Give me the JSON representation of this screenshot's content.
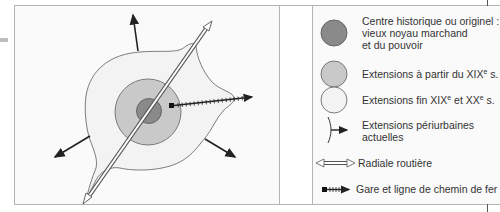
{
  "diagram": {
    "title": "",
    "colors": {
      "historic_core": "#8a8a8a",
      "ext_19th": "#c9c9c9",
      "ext_late": "#f3f3f3",
      "outline": "#6e6e6e",
      "arrow": "#222222"
    },
    "map": {
      "elements": [
        "historic-core",
        "extension-19th-century",
        "extension-late-19th-20th",
        "periurban-arrows",
        "road-radial",
        "railway-line",
        "station"
      ]
    },
    "legend": {
      "items": [
        {
          "id": "historic",
          "symbol": "dark-grey-circle",
          "lines": [
            "Centre historique ou originel :",
            "vieux noyau marchand",
            "et du pouvoir"
          ]
        },
        {
          "id": "ext19",
          "symbol": "mid-grey-circle",
          "lines": [
            "Extensions à partir du XIX",
            "e",
            " s."
          ]
        },
        {
          "id": "extlate",
          "symbol": "light-grey-circle",
          "lines": [
            "Extensions fin XIX",
            "e",
            " et XX",
            "e",
            " s."
          ]
        },
        {
          "id": "periurban",
          "symbol": "arrow-from-line",
          "lines": [
            "Extensions périurbaines",
            "actuelles"
          ]
        },
        {
          "id": "road",
          "symbol": "double-hollow-arrow",
          "lines": [
            "Radiale routière"
          ]
        },
        {
          "id": "rail",
          "symbol": "square-hatched-arrow",
          "lines": [
            "Gare et ligne de chemin de fer"
          ]
        }
      ]
    }
  }
}
